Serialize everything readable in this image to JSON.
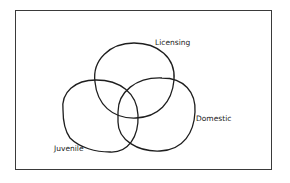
{
  "diagram": {
    "type": "venn",
    "sets": [
      {
        "id": "licensing",
        "label": "Licensing"
      },
      {
        "id": "juvenile",
        "label": "Juvenile"
      },
      {
        "id": "domestic",
        "label": "Domestic"
      }
    ],
    "colors": {
      "stroke": "#1e1e1e",
      "border": "#3a3a3a",
      "background": "#ffffff"
    }
  }
}
